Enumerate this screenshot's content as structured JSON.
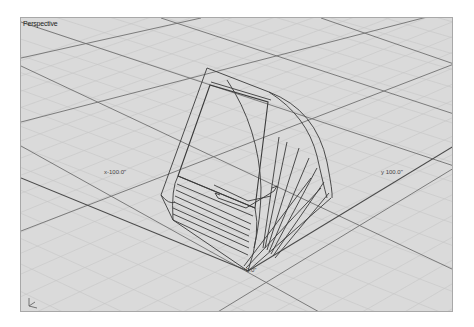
{
  "viewport": {
    "title": "Perspective",
    "background": "#d8d8d8",
    "grid_minor_color": "#c4c4c4",
    "grid_major_color": "#6e6e6e",
    "geometry_color": "#3a3a3a"
  },
  "labels": {
    "x_axis": "x-100.0\"",
    "y_axis": "y 100.0\"",
    "origin": "0.0\""
  },
  "icons": {
    "world_axes": "world-axes-icon",
    "gumball_x": "axis-arrow-icon",
    "gumball_y": "axis-arrow-icon"
  }
}
